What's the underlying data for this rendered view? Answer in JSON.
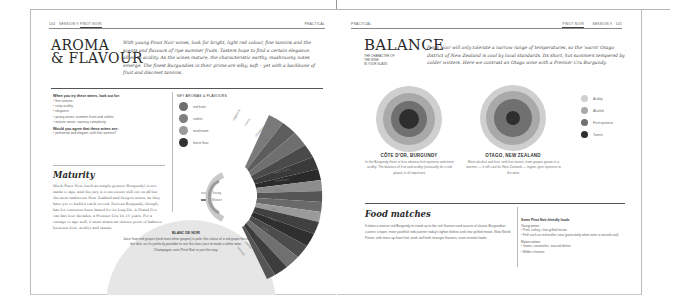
{
  "left_page": {
    "running_head": {
      "page_number": "144",
      "section": "SESSION 9",
      "topic": "PINOT NOIR",
      "right_label": "PRACTICAL"
    },
    "title_line1": "AROMA",
    "title_line2": "& FLAVOUR",
    "intro": "With young Pinot Noir wines, look for bright, light red colour, fine tannins and the scents and flavours of ripe summer fruits. Tasters hope to find a certain elegance, allied to acidity. As the wines mature, the characteristic earthy, mushroomy notes emerge. The finest Burgundies in their prime are silky, soft – yet with a backbone of fruit and discreet tannins.",
    "lookout": {
      "heading": "When you try these wines, look out for:",
      "items": [
        "fine tannins",
        "crisp acidity",
        "elegance",
        "young wines: summer fruits and violets",
        "mature wines: savoury complexity"
      ],
      "question": "Would you agree that these wines are:",
      "answers": [
        "perfumed and elegant, with fine tannins?"
      ]
    },
    "maturity": {
      "heading": "Maturity",
      "body": "Much Pinot Noir (such as simple generic Burgundy) is not made to age, and the jury is to an extent still out on all but the most ambitious New Zealand and Oregon wines, as they have yet to build a track record. Serious Burgundy, though, has for centuries been famed for its long life. A Grand Cru can last four decades, a Premier Cru 10–15 years. For a vintage to age well, it must attain an elusive point of balance between fruit, acidity and tannin."
    },
    "blanc_de_noir": {
      "title": "BLANC DE NOIR",
      "body": "Juice from red grapes (and most white grapes) is pale; the colour of a red grape lies in the skin, so it's perfectly possible to use the clear juice to make a white wine. Champagne uses Pinot Noir in just this way."
    },
    "key_aromas": {
      "heading": "KEY AROMAS & FLAVOURS",
      "legend": [
        {
          "label": "red fruits",
          "color": "#6e6e6e"
        },
        {
          "label": "violets",
          "color": "#7e7e7e"
        },
        {
          "label": "mushroom",
          "color": "#9a9a9a"
        },
        {
          "label": "forest floor",
          "color": "#333333"
        }
      ],
      "key_young": "Young",
      "key_mature": "Mature",
      "wheel_labels": [
        "raspberry",
        "cherry",
        "strawberry",
        "plum",
        "violet",
        "earthy",
        "black cherry",
        "mushroom",
        "game",
        "tobacco",
        "tea",
        "leather",
        "truffle",
        "forest floor",
        "smoke",
        "savoury"
      ]
    }
  },
  "right_page": {
    "running_head": {
      "left_label": "PRACTICAL",
      "topic": "PINOT NOIR",
      "section": "SESSION 9",
      "page_number": "145"
    },
    "title": "BALANCE",
    "subtitle_lines": [
      "THE CHARACTER OF",
      "THE WINE",
      "IN YOUR GLASS"
    ],
    "intro": "Pinot Noir will only tolerate a narrow range of temperatures, so the 'warm' Otago district of New Zealand is cool by local standards. Its short, hot summers tempered by colder winters. Here we contrast an Otago wine with a Premier Cru Burgundy.",
    "regions": [
      {
        "name": "CÔTE D'OR, BURGUNDY",
        "description": "In the Burgundy there is less obvious fruit ripeness and more acidity. The balance of fruit and acidity (unusually for a red grape) is all important."
      },
      {
        "name": "OTAGO, NEW ZEALAND",
        "description": "More alcohol and fruit, and less tannin, from grapes grown in a warmer — if still cool for New Zealand — region, give ripeness to the wine."
      }
    ],
    "balance_legend": [
      {
        "label": "Acidity",
        "color": "#cfcfcf"
      },
      {
        "label": "Alcohol",
        "color": "#a9a9a9"
      },
      {
        "label": "Fruit ripeness",
        "color": "#707070"
      },
      {
        "label": "Tannin",
        "color": "#2e2e2e"
      }
    ],
    "food": {
      "heading": "Food matches",
      "body": "It takes a mature red Burgundy to stand up to the rich flavours and sauces of classic Burgundian cuisine; crisper, more youthful reds partner today's lighter dishes and char-grilled meats. New World Pinots, with more up-front fruit, work well with stronger flavours, even oriental foods.",
      "sidebar_title": "Some Pinot Noir-friendly foods",
      "young_heading": "Young wines:",
      "young_items": [
        "Pork, turkey, char-grilled meats",
        "Fish such as red mullet, tuna (particularly when wine is served cool)"
      ],
      "mature_heading": "Mature wines:",
      "mature_items": [
        "Game, casseroles, sauced dishes",
        "Milder cheeses"
      ]
    }
  }
}
